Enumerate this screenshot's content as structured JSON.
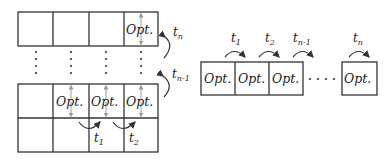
{
  "diagram": {
    "cell_label": "Opt.",
    "colors": {
      "line": "#333333",
      "arrow_gray": "#9a9a9a",
      "text": "#222222",
      "background": "#ffffff"
    },
    "left_grid": {
      "top_row": {
        "cells": [
          "",
          "",
          "",
          "Opt."
        ],
        "side_label": {
          "base": "t",
          "sub": "n"
        }
      },
      "continuation": "vertical-dots",
      "bottom_block": {
        "row1": [
          "",
          "Opt.",
          "Opt.",
          "Opt."
        ],
        "row2": [
          "",
          "",
          "",
          ""
        ],
        "side_label": {
          "base": "t",
          "sub": "n-1"
        },
        "step_labels": [
          {
            "base": "t",
            "sub": "1"
          },
          {
            "base": "t",
            "sub": "2"
          }
        ]
      }
    },
    "right_sequence": {
      "boxes": [
        "Opt.",
        "Opt.",
        "Opt.",
        "Opt."
      ],
      "ellipsis": "· · · ·",
      "step_labels": [
        {
          "base": "t",
          "sub": "1"
        },
        {
          "base": "t",
          "sub": "2"
        },
        {
          "base": "t",
          "sub": "n-1"
        },
        {
          "base": "t",
          "sub": "n"
        }
      ]
    }
  }
}
